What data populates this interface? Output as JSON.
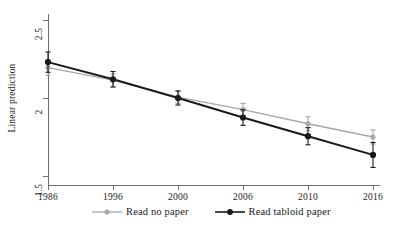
{
  "chart_data": {
    "type": "line",
    "title": "",
    "subtitle": "",
    "xlabel": "",
    "ylabel": "Linear prediction",
    "categories": [
      "1986",
      "1996",
      "2000",
      "2006",
      "2010",
      "2016"
    ],
    "x_tick_labels": [
      "1986",
      "1996",
      "2000",
      "2006",
      "2010",
      "2016"
    ],
    "y_tick_labels": [
      "1.5",
      "2",
      "2.5"
    ],
    "y_ticks": [
      1.5,
      2,
      2.5
    ],
    "ylim": [
      1.43,
      2.57
    ],
    "grid": false,
    "legend_position": "bottom",
    "error_bars": "95% CI (capped)",
    "series": [
      {
        "name": "Read no paper",
        "color": "#a8a8a8",
        "marker": "circle",
        "values": [
          2.195,
          2.115,
          2.005,
          1.925,
          1.835,
          1.75
        ],
        "ci_low": [
          2.145,
          2.075,
          1.965,
          1.885,
          1.79,
          1.705
        ],
        "ci_high": [
          2.245,
          2.155,
          2.045,
          1.965,
          1.88,
          1.795
        ]
      },
      {
        "name": "Read tabloid paper",
        "color": "#1a1a1a",
        "marker": "circle",
        "values": [
          2.23,
          2.12,
          2.0,
          1.875,
          1.755,
          1.635
        ],
        "ci_low": [
          2.165,
          2.07,
          1.955,
          1.825,
          1.7,
          1.555
        ],
        "ci_high": [
          2.295,
          2.17,
          2.045,
          1.925,
          1.81,
          1.715
        ]
      }
    ]
  },
  "legend": {
    "entries": [
      {
        "label": "Read no paper"
      },
      {
        "label": "Read tabloid paper"
      }
    ]
  }
}
